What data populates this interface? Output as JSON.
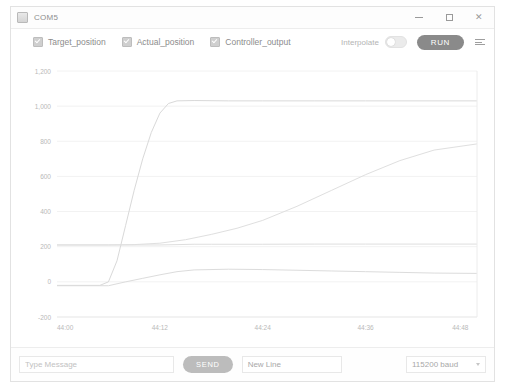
{
  "window": {
    "title": "COM5",
    "app_icon": "serial-monitor-icon",
    "controls": {
      "minimize": "minimize-icon",
      "maximize": "maximize-icon",
      "close": "close-icon"
    }
  },
  "toolbar": {
    "legend": [
      {
        "label": "Target_position",
        "checked": true,
        "color": "#d8d8d8"
      },
      {
        "label": "Actual_position",
        "checked": true,
        "color": "#dcdcdc"
      },
      {
        "label": "Controller_output",
        "checked": true,
        "color": "#dadada"
      }
    ],
    "interpolate_label": "Interpolate",
    "interpolate_on": false,
    "run_label": "RUN",
    "menu_icon": "menu-icon"
  },
  "bottom": {
    "message_placeholder": "Type Message",
    "message_value": "",
    "send_label": "SEND",
    "line_ending": "New Line",
    "baud_rate": "115200 baud"
  },
  "chart_data": {
    "type": "line",
    "title": "",
    "xlabel": "",
    "ylabel": "",
    "grid": true,
    "legend_position": "top-left",
    "ylim": [
      -200,
      1200
    ],
    "yticks": [
      "1,200",
      "1,000",
      "800",
      "600",
      "400",
      "200",
      "0",
      "-200"
    ],
    "ytick_values": [
      1200,
      1000,
      800,
      600,
      400,
      200,
      0,
      -200
    ],
    "xticks": [
      "44:00",
      "44:12",
      "44:24",
      "44:36",
      "44:48"
    ],
    "xtick_values": [
      0,
      12,
      24,
      36,
      48
    ],
    "xlim": [
      0,
      49
    ],
    "series": [
      {
        "name": "Target_position",
        "color": "#dedede",
        "x": [
          0,
          6,
          9,
          12,
          14,
          16,
          18,
          24,
          30,
          36,
          42,
          49
        ],
        "values": [
          210,
          210,
          210,
          210,
          212,
          214,
          214,
          214,
          215,
          215,
          215,
          215
        ]
      },
      {
        "name": "Actual_position",
        "color": "#d9d9d9",
        "x": [
          0,
          5,
          6,
          7,
          8,
          9,
          10,
          11,
          12,
          13,
          14,
          16,
          20,
          24,
          30,
          36,
          42,
          49
        ],
        "values": [
          -20,
          -20,
          0,
          120,
          320,
          520,
          700,
          850,
          960,
          1015,
          1030,
          1032,
          1030,
          1030,
          1030,
          1030,
          1030,
          1030
        ]
      },
      {
        "name": "Controller_output",
        "color": "#dcdcdc",
        "x": [
          0,
          6,
          8,
          10,
          12,
          14,
          16,
          20,
          24,
          28,
          32,
          36,
          40,
          44,
          49
        ],
        "values": [
          -22,
          -22,
          0,
          20,
          40,
          58,
          68,
          72,
          70,
          66,
          62,
          58,
          54,
          50,
          48
        ]
      },
      {
        "name": "Ramp_trace",
        "color": "#dfdfdf",
        "x": [
          0,
          6,
          9,
          12,
          15,
          18,
          21,
          24,
          28,
          32,
          36,
          40,
          44,
          49
        ],
        "values": [
          210,
          210,
          212,
          220,
          240,
          270,
          305,
          350,
          430,
          520,
          610,
          690,
          750,
          785
        ]
      }
    ]
  }
}
